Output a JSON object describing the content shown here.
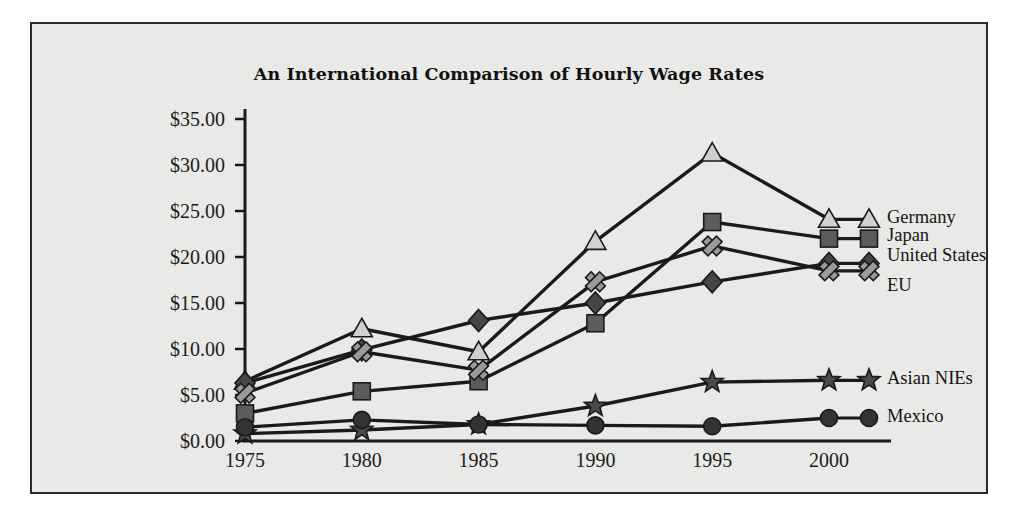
{
  "figure": {
    "background_color": "#e9e9e7",
    "border_color": "#2b2b2b",
    "page_background": "#ffffff"
  },
  "chart_data": {
    "type": "line",
    "title": "An International Comparison of Hourly Wage Rates",
    "xlabel": "",
    "ylabel": "",
    "x": [
      1975,
      1980,
      1985,
      1990,
      1995,
      2000
    ],
    "categories": [
      "1975",
      "1980",
      "1985",
      "1990",
      "1995",
      "2000"
    ],
    "xtick_labels": [
      "1975",
      "1980",
      "1985",
      "1990",
      "1995",
      "2000"
    ],
    "ytick_labels": [
      "$0.00",
      "$5.00",
      "$10.00",
      "$15.00",
      "$20.00",
      "$25.00",
      "$30.00",
      "$35.00"
    ],
    "ytick_values": [
      0,
      5,
      10,
      15,
      20,
      25,
      30,
      35
    ],
    "ylim": [
      0,
      35
    ],
    "xlim": [
      1975,
      2000
    ],
    "grid": false,
    "legend_position": "right-inline",
    "series": [
      {
        "name": "Germany",
        "marker": "triangle",
        "marker_color": "#d0d0ce",
        "line_color": "#1a1a1a",
        "values": [
          6.5,
          12.2,
          9.7,
          21.7,
          31.3,
          24.1
        ]
      },
      {
        "name": "Japan",
        "marker": "square",
        "marker_color": "#5c5c5c",
        "line_color": "#1a1a1a",
        "values": [
          3.0,
          5.4,
          6.5,
          12.8,
          23.8,
          22.0
        ]
      },
      {
        "name": "United States",
        "marker": "diamond",
        "marker_color": "#464646",
        "line_color": "#1a1a1a",
        "values": [
          6.3,
          9.9,
          13.1,
          15.0,
          17.3,
          19.3
        ]
      },
      {
        "name": "EU",
        "marker": "cross-x",
        "marker_color": "#9a9a98",
        "line_color": "#1a1a1a",
        "values": [
          5.2,
          9.7,
          7.7,
          17.3,
          21.2,
          18.5
        ]
      },
      {
        "name": "Asian NIEs",
        "marker": "star",
        "marker_color": "#4a4a4a",
        "line_color": "#1a1a1a",
        "values": [
          0.8,
          1.2,
          1.8,
          3.8,
          6.4,
          6.6
        ]
      },
      {
        "name": "Mexico",
        "marker": "circle",
        "marker_color": "#333333",
        "line_color": "#1a1a1a",
        "values": [
          1.5,
          2.3,
          1.8,
          1.7,
          1.6,
          2.5
        ]
      }
    ]
  }
}
